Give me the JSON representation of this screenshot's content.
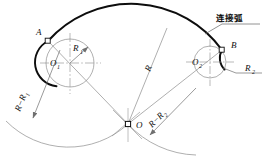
{
  "figure": {
    "title_annotation": "连接弧",
    "type": "engineering-construction-drawing",
    "background": "#ffffff",
    "ink_color": "#101010",
    "thin_color": "#8a8a8a",
    "construction_color": "#9a9a9a"
  },
  "labels": {
    "point_a": "A",
    "point_b": "B",
    "point_o": "O",
    "center_o1": "O",
    "center_o1_sub": "1",
    "center_o2": "O",
    "center_o2_sub": "2",
    "radius_r1": "R",
    "radius_r1_sub": "1",
    "radius_r2": "R",
    "radius_r2_sub": "2",
    "radius_r": "R",
    "diff_left": "R−R",
    "diff_left_sub": "1",
    "diff_right": "R−R",
    "diff_right_sub": "2",
    "connecting_arc": "连接弧"
  },
  "geometry": {
    "circle1": {
      "cx": 70,
      "cy": 63,
      "r": 24,
      "label": "O1"
    },
    "circle2": {
      "cx": 210,
      "cy": 62,
      "r": 16,
      "label": "O2"
    },
    "center_o": {
      "x": 128,
      "y": 124,
      "label": "O"
    },
    "tangent_point_a": {
      "x": 48,
      "y": 41
    },
    "tangent_point_b": {
      "x": 222,
      "y": 50
    },
    "big_arc_radius": 112,
    "aux_arc_left_radius": 88,
    "aux_arc_right_radius": 96
  }
}
